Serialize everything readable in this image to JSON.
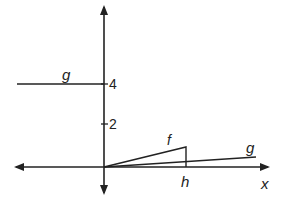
{
  "diagram": {
    "axes": {
      "x_label": "x"
    },
    "ticks": [
      {
        "label": "4",
        "value": 4
      },
      {
        "label": "2",
        "value": 2
      }
    ],
    "curves": [
      {
        "name": "g",
        "label": "g",
        "description": "horizontal line at y=4 for x<0"
      },
      {
        "name": "f",
        "label": "f",
        "description": "line from origin rising to x=h, then vertical drop to axis"
      },
      {
        "name": "g2",
        "label": "g",
        "description": "shallow line from origin for x>0"
      }
    ],
    "markers": [
      {
        "label": "h"
      }
    ],
    "colors": {
      "stroke": "#222222",
      "background": "#ffffff"
    }
  }
}
